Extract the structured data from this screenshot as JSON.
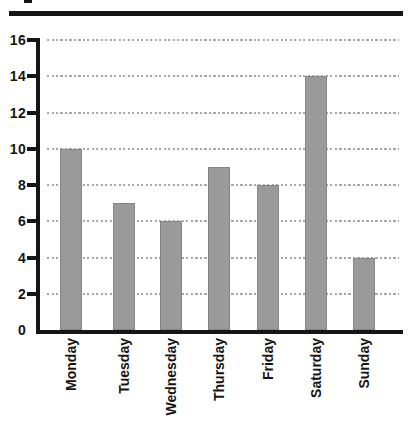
{
  "chart_data": {
    "type": "bar",
    "title": "",
    "xlabel": "",
    "ylabel": "",
    "categories": [
      "Monday",
      "Tuesday",
      "Wednesday",
      "Thursday",
      "Friday",
      "Saturday",
      "Sunday"
    ],
    "values": [
      10,
      7,
      6,
      9,
      8,
      14,
      4
    ],
    "ylim": [
      0,
      16
    ],
    "yticks": [
      16,
      14,
      12,
      10,
      8,
      6,
      4,
      2,
      0
    ],
    "grid": "horizontal-dotted",
    "legend": "none",
    "bar_color": "#9a9a9a",
    "axis_color": "#151515",
    "grid_color": "#a8a8a8",
    "label_color": "#141414"
  },
  "decorations": {
    "top_rule": "thick black horizontal rule across top",
    "title_fragment": "tiny cropped glyph remnant above top rule"
  }
}
